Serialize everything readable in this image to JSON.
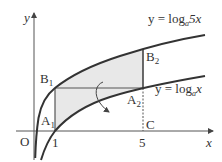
{
  "diagram": {
    "axes": {
      "x_label": "x",
      "y_label": "y",
      "origin_label": "O"
    },
    "ticks": {
      "x1": "1",
      "x5": "5"
    },
    "curves": {
      "upper": {
        "prefix": "y = log",
        "base": "a",
        "arg": "5x"
      },
      "lower": {
        "prefix": "y = log",
        "base": "a",
        "arg": "x"
      }
    },
    "points": {
      "A1": {
        "letter": "A",
        "index": "1"
      },
      "A2": {
        "letter": "A",
        "index": "2"
      },
      "B1": {
        "letter": "B",
        "index": "1"
      },
      "B2": {
        "letter": "B",
        "index": "2"
      },
      "C": {
        "letter": "C"
      }
    },
    "colors": {
      "line": "#333333",
      "shade": "#e6e6e6",
      "axis": "#555555"
    }
  }
}
